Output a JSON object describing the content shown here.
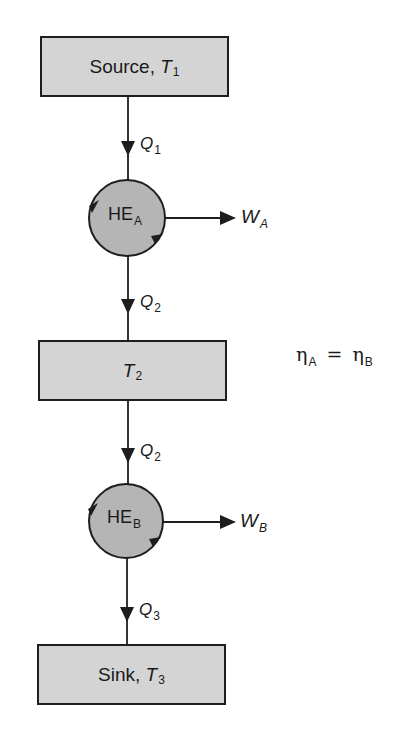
{
  "diagram": {
    "reservoirs": {
      "source": {
        "label": "Source, ",
        "symbol": "T",
        "subscript": "1"
      },
      "intermediate": {
        "label": "",
        "symbol": "T",
        "subscript": "2"
      },
      "sink": {
        "label": "Sink, ",
        "symbol": "T",
        "subscript": "3"
      }
    },
    "engines": {
      "a": {
        "label": "HE",
        "subscript": "A"
      },
      "b": {
        "label": "HE",
        "subscript": "B"
      }
    },
    "heat_flows": {
      "q1": {
        "symbol": "Q",
        "subscript": "1"
      },
      "q2_upper": {
        "symbol": "Q",
        "subscript": "2"
      },
      "q2_lower": {
        "symbol": "Q",
        "subscript": "2"
      },
      "q3": {
        "symbol": "Q",
        "subscript": "3"
      }
    },
    "work_outputs": {
      "wa": {
        "symbol": "W",
        "subscript": "A"
      },
      "wb": {
        "symbol": "W",
        "subscript": "B"
      }
    },
    "equation": {
      "lhs_symbol": "η",
      "lhs_subscript": "A",
      "operator": "=",
      "rhs_symbol": "η",
      "rhs_subscript": "B"
    },
    "colors": {
      "box_fill": "#d4d4d4",
      "engine_fill": "#b5b5b5",
      "stroke": "#1e1e1e"
    }
  }
}
